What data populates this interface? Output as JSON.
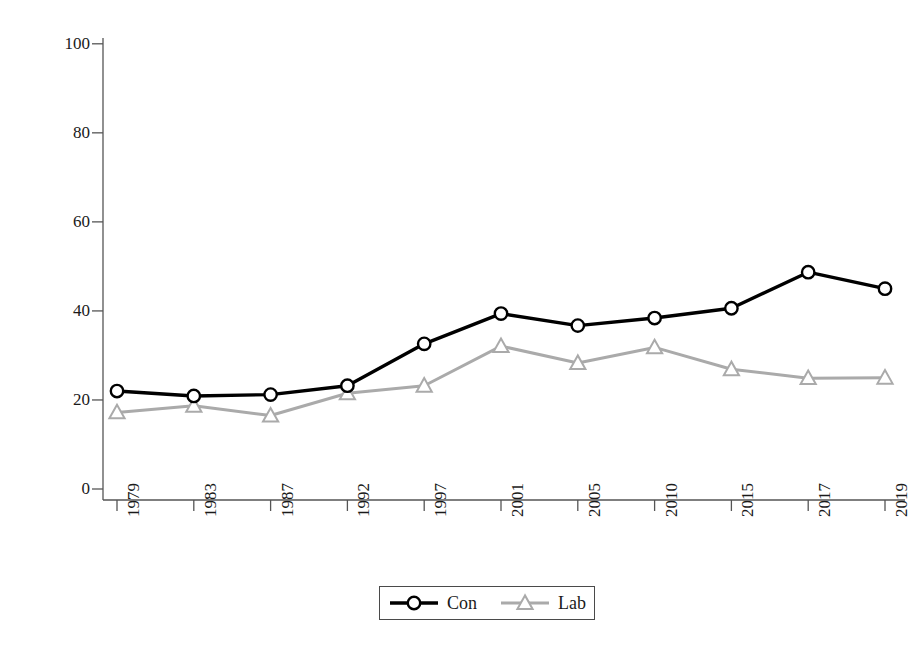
{
  "chart_data": {
    "type": "line",
    "title": "",
    "xlabel": "",
    "ylabel": "As a proportion of party's vote (%)",
    "categories": [
      "1979",
      "1983",
      "1987",
      "1992",
      "1997",
      "2001",
      "2005",
      "2010",
      "2015",
      "2017",
      "2019"
    ],
    "ylim": [
      0,
      100
    ],
    "yticks": [
      0,
      20,
      40,
      60,
      80,
      100
    ],
    "grid": false,
    "legend_position": "bottom-center",
    "series": [
      {
        "name": "Con",
        "color": "#000000",
        "marker": "circle",
        "values": [
          22.0,
          20.9,
          21.2,
          23.2,
          32.6,
          39.4,
          36.7,
          38.4,
          40.6,
          48.7,
          45.0
        ]
      },
      {
        "name": "Lab",
        "color": "#aaaaaa",
        "marker": "triangle",
        "values": [
          17.2,
          18.7,
          16.5,
          21.5,
          23.2,
          32.1,
          28.3,
          31.8,
          26.9,
          24.9,
          25.0
        ]
      }
    ]
  },
  "axis": {
    "y_tick_labels": [
      "0",
      "20",
      "40",
      "60",
      "80",
      "100"
    ],
    "x_tick_labels": [
      "1979",
      "1983",
      "1987",
      "1992",
      "1997",
      "2001",
      "2005",
      "2010",
      "2015",
      "2017",
      "2019"
    ],
    "y_axis_title": "As a proportion of party's vote (%)"
  },
  "legend": {
    "entries": [
      {
        "label": "Con",
        "color": "#000000",
        "marker": "circle"
      },
      {
        "label": "Lab",
        "color": "#aaaaaa",
        "marker": "triangle"
      }
    ]
  },
  "colors": {
    "con": "#000000",
    "lab": "#aaaaaa",
    "axis": "#555555",
    "text": "#1a1a1a",
    "background": "#ffffff"
  }
}
